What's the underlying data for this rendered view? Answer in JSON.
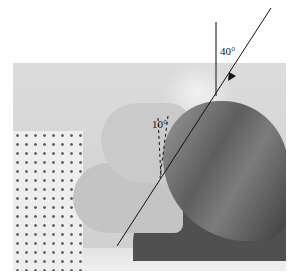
{
  "image": {
    "description": "Grayscale photo of a patient lying supine with head tilted back, overlaid with radiographic positioning lines",
    "annotations": {
      "central_ray_angle": "40°",
      "head_tilt_angle": "10°"
    },
    "colors": {
      "line": "#111111",
      "background": "#ffffff"
    }
  }
}
